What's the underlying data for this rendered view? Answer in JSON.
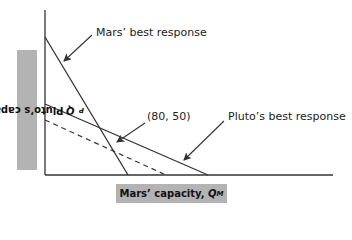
{
  "diagram": {
    "y_axis_label": {
      "text": "Pluto’s capacity, ",
      "var": "Q",
      "sub": "P"
    },
    "x_axis_label": {
      "text": "Mars’ capacity, ",
      "var": "Q",
      "sub": "M"
    },
    "annotations": {
      "mars_br": "Mars’ best response",
      "equilibrium": "(80, 50)",
      "pluto_br": "Pluto’s best response"
    },
    "lines": [
      {
        "name": "Mars’ best response",
        "style": "solid"
      },
      {
        "name": "Pluto’s best response",
        "style": "solid"
      },
      {
        "name": "Pluto’s shifted best response",
        "style": "dashed"
      }
    ],
    "colors": {
      "line": "#333333",
      "label_box": "#b3b3b3"
    }
  }
}
